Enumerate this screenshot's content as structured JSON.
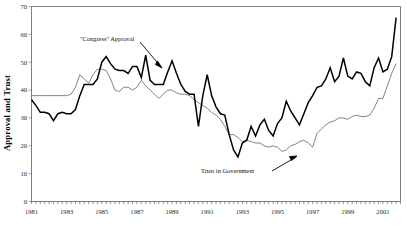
{
  "chart_data": {
    "type": "line",
    "title": "",
    "xlabel": "",
    "ylabel": "Approval and Trust",
    "ylim": [
      0,
      70
    ],
    "ytick_step": 10,
    "yticks": [
      "0",
      "10",
      "20",
      "30",
      "40",
      "50",
      "60",
      "70"
    ],
    "xlim": [
      1981,
      2002
    ],
    "xticks": [
      "1981",
      "1983",
      "1985",
      "1987",
      "1989",
      "1991",
      "1993",
      "1995",
      "1997",
      "1999",
      "2001"
    ],
    "grid": false,
    "legend_position": "none",
    "annotations": [
      {
        "id": "approval-annotation",
        "text": "\"Congress\" Approval",
        "points_to_series": "\"Congress\" Approval"
      },
      {
        "id": "trust-annotation",
        "text": "Trust in Government",
        "points_to_series": "Trust in Government"
      }
    ],
    "series": [
      {
        "name": "\"Congress\" Approval",
        "color": "#000000",
        "style": "thick-black",
        "x": [
          1981.0,
          1981.25,
          1981.5,
          1981.75,
          1982.0,
          1982.25,
          1982.5,
          1982.75,
          1983.0,
          1983.25,
          1983.5,
          1983.75,
          1984.0,
          1984.25,
          1984.5,
          1984.75,
          1985.0,
          1985.25,
          1985.5,
          1985.75,
          1986.0,
          1986.25,
          1986.5,
          1986.75,
          1987.0,
          1987.25,
          1987.5,
          1987.75,
          1988.0,
          1988.25,
          1988.5,
          1988.75,
          1989.0,
          1989.25,
          1989.5,
          1989.75,
          1990.0,
          1990.25,
          1990.5,
          1990.75,
          1991.0,
          1991.25,
          1991.5,
          1991.75,
          1992.0,
          1992.25,
          1992.5,
          1992.75,
          1993.0,
          1993.25,
          1993.5,
          1993.75,
          1994.0,
          1994.25,
          1994.5,
          1994.75,
          1995.0,
          1995.25,
          1995.5,
          1995.75,
          1996.0,
          1996.25,
          1996.5,
          1996.75,
          1997.0,
          1997.25,
          1997.5,
          1997.75,
          1998.0,
          1998.25,
          1998.5,
          1998.75,
          1999.0,
          1999.25,
          1999.5,
          1999.75,
          2000.0,
          2000.25,
          2000.5,
          2000.75,
          2001.0,
          2001.25,
          2001.5,
          2001.75
        ],
        "values": [
          36.5,
          34.5,
          32.0,
          32.0,
          31.5,
          29.0,
          31.5,
          32.0,
          31.5,
          31.5,
          33.0,
          38.0,
          42.0,
          42.0,
          42.0,
          44.0,
          50.0,
          52.0,
          49.5,
          47.5,
          47.0,
          47.0,
          46.0,
          48.5,
          48.5,
          44.5,
          52.5,
          43.5,
          42.0,
          42.0,
          42.0,
          46.5,
          50.5,
          46.0,
          42.0,
          39.5,
          38.5,
          38.5,
          27.0,
          38.0,
          45.5,
          38.0,
          34.0,
          31.5,
          31.0,
          24.0,
          18.5,
          16.0,
          21.0,
          22.0,
          27.0,
          23.5,
          27.5,
          29.5,
          25.5,
          23.5,
          28.0,
          30.0,
          36.0,
          32.5,
          30.0,
          27.5,
          31.5,
          35.5,
          38.0,
          41.0,
          41.5,
          44.0,
          48.0,
          43.0,
          45.0,
          51.5,
          45.0,
          44.0,
          46.5,
          46.0,
          43.0,
          41.5,
          48.0,
          51.5,
          46.5,
          47.5,
          52.0,
          66.0
        ]
      },
      {
        "name": "Trust in Government",
        "color": "#5a5a5a",
        "style": "thin-gray",
        "x": [
          1981.0,
          1981.25,
          1981.5,
          1981.75,
          1982.0,
          1982.25,
          1982.5,
          1982.75,
          1983.0,
          1983.25,
          1983.5,
          1983.75,
          1984.0,
          1984.25,
          1984.5,
          1984.75,
          1985.0,
          1985.25,
          1985.5,
          1985.75,
          1986.0,
          1986.25,
          1986.5,
          1986.75,
          1987.0,
          1987.25,
          1987.5,
          1987.75,
          1988.0,
          1988.25,
          1988.5,
          1988.75,
          1989.0,
          1989.25,
          1989.5,
          1989.75,
          1990.0,
          1990.25,
          1990.5,
          1990.75,
          1991.0,
          1991.25,
          1991.5,
          1991.75,
          1992.0,
          1992.25,
          1992.5,
          1992.75,
          1993.0,
          1993.25,
          1993.5,
          1993.75,
          1994.0,
          1994.25,
          1994.5,
          1994.75,
          1995.0,
          1995.25,
          1995.5,
          1995.75,
          1996.0,
          1996.25,
          1996.5,
          1996.75,
          1997.0,
          1997.25,
          1997.5,
          1997.75,
          1998.0,
          1998.25,
          1998.5,
          1998.75,
          1999.0,
          1999.25,
          1999.5,
          1999.75,
          2000.0,
          2000.25,
          2000.5,
          2000.75,
          2001.0,
          2001.25,
          2001.5,
          2001.75
        ],
        "values": [
          38.0,
          38.0,
          38.0,
          38.0,
          38.0,
          38.0,
          38.0,
          38.0,
          38.0,
          38.5,
          41.0,
          45.5,
          44.0,
          42.5,
          45.5,
          47.5,
          47.5,
          47.0,
          44.0,
          40.0,
          39.5,
          41.0,
          41.0,
          40.0,
          41.0,
          43.5,
          41.5,
          40.0,
          38.5,
          37.0,
          38.5,
          40.0,
          40.0,
          39.0,
          38.5,
          38.5,
          38.0,
          36.5,
          35.5,
          34.5,
          33.5,
          32.0,
          31.0,
          29.5,
          27.0,
          24.0,
          24.0,
          23.0,
          21.5,
          22.0,
          21.5,
          21.0,
          21.0,
          20.0,
          19.5,
          20.0,
          19.5,
          18.0,
          18.5,
          20.0,
          20.5,
          21.5,
          22.0,
          21.0,
          19.5,
          24.5,
          26.0,
          27.5,
          28.5,
          29.0,
          30.0,
          30.0,
          29.5,
          30.5,
          31.0,
          30.5,
          30.5,
          31.0,
          33.5,
          37.0,
          37.0,
          41.5,
          46.0,
          49.5
        ]
      }
    ]
  }
}
